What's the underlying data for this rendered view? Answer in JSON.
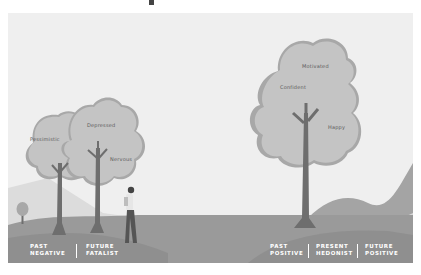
{
  "scene": {
    "colors": {
      "sky": "#efefef",
      "ground": "#9a9a9a",
      "ground_dark": "#8c8c8c",
      "canopy": "#c4c4c4",
      "canopy_shadow": "#a8a8a8",
      "trunk": "#6e6e6e",
      "label_text": "#ffffff"
    },
    "left_trees": [
      {
        "label": "Pessimistic"
      },
      {
        "label": "Depressed"
      },
      {
        "label": "Nervous"
      }
    ],
    "right_tree": [
      {
        "label": "Motivated"
      },
      {
        "label": "Confident"
      },
      {
        "label": "Happy"
      }
    ],
    "categories": [
      {
        "line1": "PAST",
        "line2": "NEGATIVE"
      },
      {
        "line1": "FUTURE",
        "line2": "FATALIST"
      },
      {
        "line1": "PAST",
        "line2": "POSITIVE"
      },
      {
        "line1": "PRESENT",
        "line2": "HEDONIST"
      },
      {
        "line1": "FUTURE",
        "line2": "POSITIVE"
      }
    ]
  }
}
